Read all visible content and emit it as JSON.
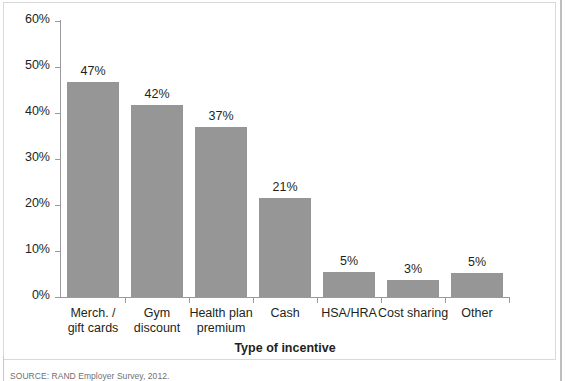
{
  "chart_data": {
    "type": "bar",
    "title": "",
    "xlabel": "Type of incentive",
    "ylabel": "",
    "categories": [
      "Merch. / gift cards",
      "Gym discount",
      "Health plan premium",
      "Cash",
      "HSA/HRA",
      "Cost sharing",
      "Other"
    ],
    "category_lines": [
      [
        "Merch. /",
        "gift cards"
      ],
      [
        "Gym",
        "discount"
      ],
      [
        "Health plan",
        "premium"
      ],
      [
        "Cash"
      ],
      [
        "HSA/HRA"
      ],
      [
        "Cost sharing"
      ],
      [
        "Other"
      ]
    ],
    "values": [
      47,
      42,
      37,
      21,
      5,
      3,
      5
    ],
    "plotted_values": [
      46.7,
      41.8,
      37.0,
      21.5,
      5.5,
      3.7,
      5.3
    ],
    "data_labels": [
      "47%",
      "42%",
      "37%",
      "21%",
      "5%",
      "3%",
      "5%"
    ],
    "ylim": [
      0,
      60
    ],
    "ytick_values": [
      0,
      10,
      20,
      30,
      40,
      50,
      60
    ],
    "ytick_labels": [
      "0%",
      "10%",
      "20%",
      "30%",
      "40%",
      "50%",
      "60%"
    ],
    "grid": false,
    "legend": null,
    "bar_color": "#969696",
    "axis_color": "#9a9a9a",
    "text_color": "#231f20",
    "frame_color": "#d9d9d9",
    "background": "#ffffff"
  },
  "footer": {
    "source_note": "SOURCE: RAND Employer Survey, 2012."
  }
}
